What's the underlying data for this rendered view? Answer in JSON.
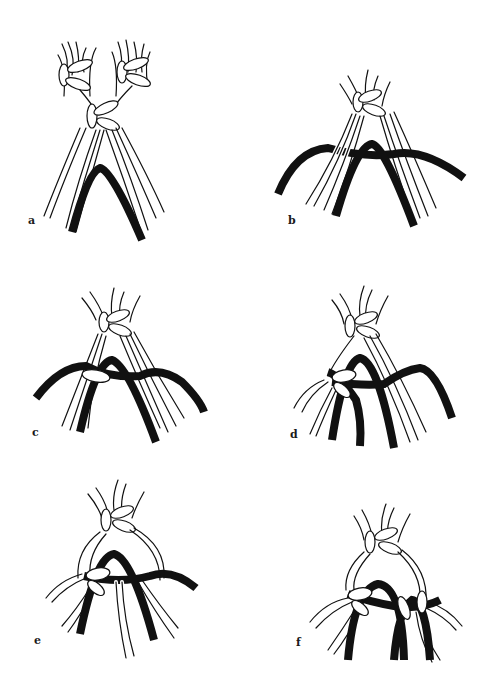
{
  "figure": {
    "panels": [
      {
        "id": "a",
        "label": "a"
      },
      {
        "id": "b",
        "label": "b"
      },
      {
        "id": "c",
        "label": "c"
      },
      {
        "id": "d",
        "label": "d"
      },
      {
        "id": "e",
        "label": "e"
      },
      {
        "id": "f",
        "label": "f"
      }
    ],
    "colors": {
      "background": "#ffffff",
      "ink": "#111111",
      "holding_cord": "#111111",
      "working_cord_fill": "#ffffff"
    }
  }
}
